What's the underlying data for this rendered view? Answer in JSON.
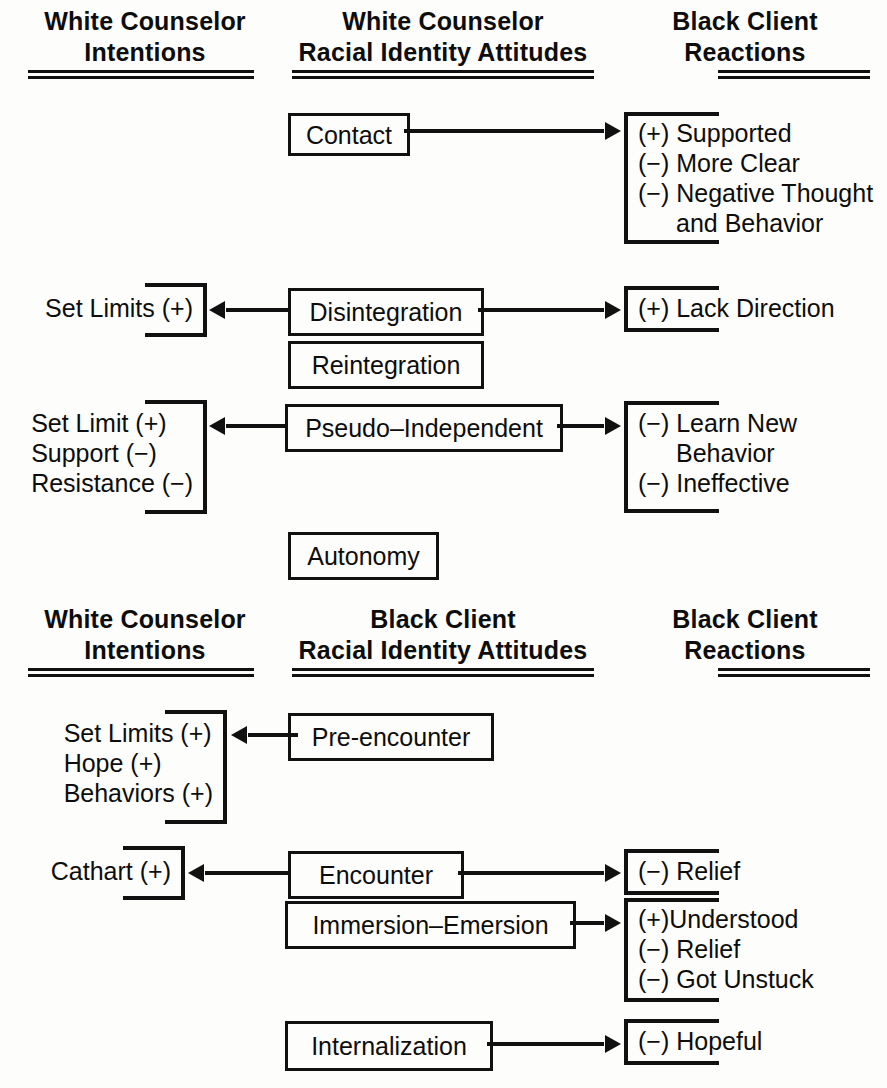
{
  "figure": {
    "panels": [
      {
        "id": "panel-white-counselor",
        "headers": {
          "left": {
            "line1": "White Counselor",
            "line2": "Intentions"
          },
          "center": {
            "line1": "White Counselor",
            "line2": "Racial Identity Attitudes"
          },
          "right": {
            "line1": "Black Client",
            "line2": "Reactions"
          }
        },
        "rows": [
          {
            "stage": "Contact",
            "intentions": [],
            "reactions": [
              "(+) Supported",
              "(−) More Clear",
              "(−) Negative Thought",
              "and Behavior"
            ],
            "arrow_left": false,
            "arrow_right": true
          },
          {
            "stage": "Disintegration",
            "intentions": [
              "Set Limits (+)"
            ],
            "reactions": [
              "(+) Lack Direction"
            ],
            "arrow_left": true,
            "arrow_right": true
          },
          {
            "stage": "Reintegration",
            "intentions": [],
            "reactions": [],
            "arrow_left": false,
            "arrow_right": false
          },
          {
            "stage": "Pseudo–Independent",
            "intentions": [
              "Set Limit (+)",
              "Support (−)",
              "Resistance (−)"
            ],
            "reactions": [
              "(−) Learn New",
              "Behavior",
              "(−) Ineffective"
            ],
            "arrow_left": true,
            "arrow_right": true
          },
          {
            "stage": "Autonomy",
            "intentions": [],
            "reactions": [],
            "arrow_left": false,
            "arrow_right": false
          }
        ]
      },
      {
        "id": "panel-black-client",
        "headers": {
          "left": {
            "line1": "White Counselor",
            "line2": "Intentions"
          },
          "center": {
            "line1": "Black Client",
            "line2": "Racial Identity Attitudes"
          },
          "right": {
            "line1": "Black Client",
            "line2": "Reactions"
          }
        },
        "rows": [
          {
            "stage": "Pre-encounter",
            "intentions": [
              "Set Limits (+)",
              "Hope (+)",
              "Behaviors (+)"
            ],
            "reactions": [],
            "arrow_left": true,
            "arrow_right": false
          },
          {
            "stage": "Encounter",
            "intentions": [
              "Cathart (+)"
            ],
            "reactions": [
              "(−) Relief"
            ],
            "arrow_left": true,
            "arrow_right": true
          },
          {
            "stage": "Immersion–Emersion",
            "intentions": [],
            "reactions": [
              "(+)Understood",
              "(−) Relief",
              "(−) Got Unstuck"
            ],
            "arrow_left": false,
            "arrow_right": true
          },
          {
            "stage": "Internalization",
            "intentions": [],
            "reactions": [
              "(−) Hopeful"
            ],
            "arrow_left": false,
            "arrow_right": true
          }
        ]
      }
    ],
    "colors": {
      "ink": "#111111",
      "paper": "#fdfdfb"
    }
  }
}
